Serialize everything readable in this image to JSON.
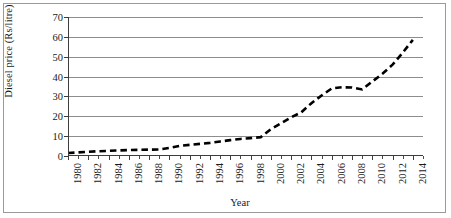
{
  "chart_data": {
    "type": "line",
    "title": "",
    "xlabel": "Year",
    "ylabel": "Diesel price (Rs/litre)",
    "xlim": [
      1980,
      2015
    ],
    "ylim": [
      0,
      70
    ],
    "yticks": [
      0,
      10,
      20,
      30,
      40,
      50,
      60,
      70
    ],
    "xticks": [
      1980,
      1982,
      1984,
      1986,
      1988,
      1990,
      1992,
      1994,
      1996,
      1998,
      2000,
      2002,
      2004,
      2006,
      2008,
      2010,
      2012,
      2014
    ],
    "grid": "horizontal",
    "legend": "none",
    "line_style": "dashed",
    "line_color": "#000000",
    "x": [
      1980,
      1981,
      1982,
      1983,
      1984,
      1985,
      1986,
      1987,
      1988,
      1989,
      1990,
      1991,
      1992,
      1993,
      1994,
      1995,
      1996,
      1997,
      1998,
      1999,
      2000,
      2001,
      2002,
      2003,
      2004,
      2005,
      2006,
      2007,
      2008,
      2009,
      2010,
      2011,
      2012,
      2013,
      2014
    ],
    "values": [
      1.5,
      1.8,
      2.1,
      2.4,
      2.6,
      2.8,
      3.0,
      3.1,
      3.2,
      3.3,
      4.1,
      5.1,
      5.6,
      6.1,
      6.6,
      7.3,
      8.0,
      8.6,
      9.0,
      9.5,
      13.5,
      16.4,
      19.5,
      22.0,
      26.6,
      30.5,
      34.0,
      34.6,
      34.5,
      33.5,
      37.5,
      41.4,
      46.0,
      52.0,
      58.5
    ]
  },
  "axis": {
    "y_tick_labels": [
      "0",
      "10",
      "20",
      "30",
      "40",
      "50",
      "60",
      "70"
    ],
    "x_tick_labels": [
      "1980",
      "1982",
      "1984",
      "1986",
      "1988",
      "1990",
      "1992",
      "1994",
      "1996",
      "1998",
      "2000",
      "2002",
      "2004",
      "2006",
      "2008",
      "2010",
      "2012",
      "2014"
    ]
  }
}
